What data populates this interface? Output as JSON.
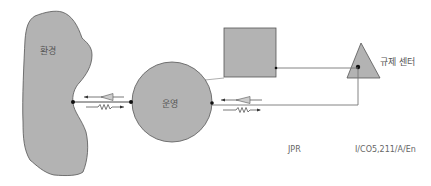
{
  "diagram": {
    "nodes": {
      "environment": {
        "label": "환경",
        "shape": "irregular-blob"
      },
      "operation": {
        "label": "운영",
        "shape": "circle"
      },
      "unlabeled_box": {
        "label": "",
        "shape": "square"
      },
      "control_center": {
        "label": "규제 센터",
        "shape": "triangle"
      }
    },
    "edges": [
      {
        "from": "environment",
        "to": "operation",
        "arrows": [
          "left-pointing arrow with triangle",
          "right-pointing arrow with zigzag"
        ]
      },
      {
        "from": "operation",
        "to": "control_center",
        "arrows": [
          "left-pointing arrow with triangle",
          "right-pointing arrow with zigzag"
        ]
      },
      {
        "from": "unlabeled_box",
        "to": "control_center",
        "arrows": []
      },
      {
        "from": "operation",
        "to": "unlabeled_box",
        "arrows": []
      }
    ],
    "footer": {
      "left": "JPR",
      "right": "I/CO5,211/A/En"
    },
    "colors": {
      "fill": "#b3b3b3",
      "stroke": "#555555",
      "line": "#777777",
      "dot": "#111111"
    }
  }
}
